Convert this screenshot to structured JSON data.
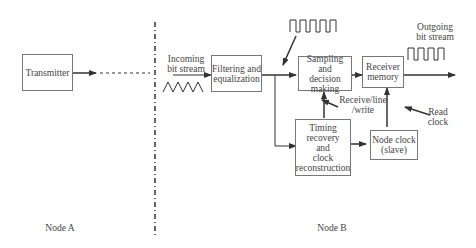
{
  "diagram": {
    "nodes": {
      "transmitter": "Transmitter",
      "filtering": "Filtering and equalization",
      "sampling": "Sampling and decision making",
      "receiver_memory": "Receiver memory",
      "timing": "Timing recovery and clock reconstruction",
      "node_clock": "Node clock (slave)"
    },
    "labels": {
      "incoming_line1": "Incoming",
      "incoming_line2": "bit stream",
      "outgoing_line1": "Outgoing",
      "outgoing_line2": "bit stream",
      "receive_line1": "Receive/line",
      "receive_line2": "/write",
      "read_clock_line1": "Read",
      "read_clock_line2": "clock",
      "node_a": "Node A",
      "node_b": "Node B"
    },
    "sampling_lines": [
      "Sampling and",
      "decision",
      "making"
    ],
    "memory_lines": [
      "Receiver",
      "memory"
    ],
    "timing_lines": [
      "Timing",
      "recovery",
      "and",
      "clock",
      "reconstruction"
    ],
    "clock_lines": [
      "Node clock",
      "(slave)"
    ],
    "filter_lines": [
      "Filtering and",
      "equalization"
    ]
  }
}
